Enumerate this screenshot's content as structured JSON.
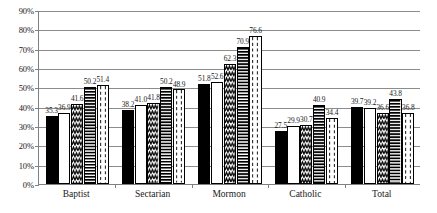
{
  "chart_data": {
    "type": "bar",
    "title": "",
    "subtitle": "",
    "xlabel": "",
    "ylabel": "",
    "ylim": [
      0,
      90
    ],
    "ytick_step": 10,
    "ytick_labels": [
      "0%",
      "10%",
      "20%",
      "30%",
      "40%",
      "50%",
      "60%",
      "70%",
      "80%",
      "90%"
    ],
    "ytick_values": [
      0,
      10,
      20,
      30,
      40,
      50,
      60,
      70,
      80,
      90
    ],
    "grid": true,
    "grid_axis": "y",
    "legend": false,
    "legend_position": "none",
    "categories": [
      "Baptist",
      "Sectarian",
      "Mormon",
      "Catholic",
      "Total"
    ],
    "series": [
      {
        "name": "series-1",
        "pattern": "solid-black",
        "values": [
          35.3,
          38.2,
          51.8,
          27.5,
          39.7
        ],
        "labels": [
          "35.3",
          "38.2",
          "51.8",
          "27.5",
          "39.7"
        ]
      },
      {
        "name": "series-2",
        "pattern": "plain-white",
        "values": [
          36.9,
          41.0,
          52.6,
          29.9,
          39.2
        ],
        "labels": [
          "36.9",
          "41.0",
          "52.6",
          "29.9",
          "39.2"
        ]
      },
      {
        "name": "series-3",
        "pattern": "zigzag-wave",
        "values": [
          41.6,
          41.8,
          62.3,
          30.7,
          36.6
        ],
        "labels": [
          "41.6",
          "41.8",
          "62.3",
          "30.7",
          "36.6"
        ]
      },
      {
        "name": "series-4",
        "pattern": "horizontal-stripes",
        "values": [
          50.2,
          50.2,
          70.9,
          40.9,
          43.8
        ],
        "labels": [
          "50.2",
          "50.2",
          "70.9",
          "40.9",
          "43.8"
        ]
      },
      {
        "name": "series-5",
        "pattern": "dashed-vertical",
        "values": [
          51.4,
          48.9,
          76.6,
          34.4,
          36.8
        ],
        "labels": [
          "51.4",
          "48.9",
          "76.6",
          "34.4",
          "36.8"
        ]
      }
    ]
  }
}
